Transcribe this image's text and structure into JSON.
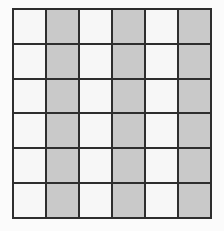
{
  "figure": {
    "name": "striped-grid",
    "rows": 6,
    "columns": 6,
    "background_color": "#fbfbfb",
    "line_color": "#2e2e2e",
    "line_width_px": 2,
    "light_cell_color": "#f7f7f7",
    "shaded_cell_color": "#c9c9c9",
    "pattern_description": "alternating vertical stripes: odd columns light, even columns shaded",
    "column_fills": [
      "light",
      "shaded",
      "light",
      "shaded",
      "light",
      "shaded"
    ],
    "cells": [
      [
        "light",
        "shaded",
        "light",
        "shaded",
        "light",
        "shaded"
      ],
      [
        "light",
        "shaded",
        "light",
        "shaded",
        "light",
        "shaded"
      ],
      [
        "light",
        "shaded",
        "light",
        "shaded",
        "light",
        "shaded"
      ],
      [
        "light",
        "shaded",
        "light",
        "shaded",
        "light",
        "shaded"
      ],
      [
        "light",
        "shaded",
        "light",
        "shaded",
        "light",
        "shaded"
      ],
      [
        "light",
        "shaded",
        "light",
        "shaded",
        "light",
        "shaded"
      ]
    ]
  }
}
